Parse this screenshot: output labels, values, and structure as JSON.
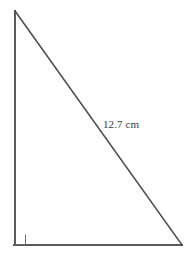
{
  "figure": {
    "kind": "geometry-diagram",
    "shape_name": "right-triangle",
    "background_color": "#ffffff",
    "stroke_color": "#5a5a5a",
    "hypotenuse_color": "#4a4a4a",
    "marker_color": "#6b6b6b",
    "text_color": "#3a3a3a"
  },
  "labels": {
    "hypotenuse_length": "12.7 cm"
  },
  "geometry": {
    "vertices": {
      "apex": {
        "x": 15,
        "y": 11
      },
      "bottom_left": {
        "x": 15,
        "y": 245
      },
      "bottom_right": {
        "x": 182,
        "y": 245
      }
    },
    "right_angle_marker": {
      "at_vertex": "bottom_left",
      "size": 10
    },
    "sides": [
      {
        "name": "vertical-leg",
        "from": "apex",
        "to": "bottom_left"
      },
      {
        "name": "horizontal-leg",
        "from": "bottom_left",
        "to": "bottom_right"
      },
      {
        "name": "hypotenuse",
        "from": "apex",
        "to": "bottom_right",
        "label": "12.7 cm"
      }
    ]
  }
}
